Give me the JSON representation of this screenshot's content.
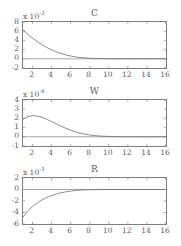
{
  "figure": {
    "background": "#ffffff",
    "line_color": "#6e6e6e",
    "axis_color": "#7d7d7d",
    "text_color": "#5a5a5a"
  },
  "panels": [
    {
      "title": "C",
      "exponent_prefix": "x 10",
      "exponent_value": "-3",
      "y_ticks": [
        "8",
        "6",
        "4",
        "2",
        "0",
        "-2"
      ],
      "x_ticks": [
        "2",
        "4",
        "6",
        "8",
        "10",
        "12",
        "14",
        "16"
      ]
    },
    {
      "title": "W",
      "exponent_prefix": "x 10",
      "exponent_value": "-4",
      "y_ticks": [
        "4",
        "3",
        "2",
        "1",
        "0",
        "-1"
      ],
      "x_ticks": [
        "2",
        "4",
        "6",
        "8",
        "10",
        "12",
        "14",
        "16"
      ]
    },
    {
      "title": "R",
      "exponent_prefix": "x 10",
      "exponent_value": "-3",
      "y_ticks": [
        "2",
        "0",
        "-2",
        "-4",
        "-6"
      ],
      "x_ticks": [
        "2",
        "4",
        "6",
        "8",
        "10",
        "12",
        "14",
        "16"
      ]
    }
  ],
  "chart_data": [
    {
      "type": "line",
      "title": "C",
      "xlabel": "",
      "ylabel": "",
      "y_scale": "1e-3",
      "xlim": [
        1,
        16
      ],
      "ylim": [
        -2,
        8
      ],
      "grid": false,
      "legend": "none",
      "x": [
        1,
        1.5,
        2,
        2.5,
        3,
        3.5,
        4,
        4.5,
        5,
        5.5,
        6,
        6.5,
        7,
        8,
        9,
        10,
        11,
        12,
        13,
        14,
        15,
        16
      ],
      "y": [
        6.3,
        5.35,
        4.5,
        3.75,
        3.05,
        2.45,
        1.95,
        1.5,
        1.15,
        0.85,
        0.6,
        0.42,
        0.28,
        0.12,
        0.05,
        0.02,
        0.01,
        0.0,
        0.0,
        0.0,
        0.0,
        0.0
      ]
    },
    {
      "type": "line",
      "title": "W",
      "xlabel": "",
      "ylabel": "",
      "y_scale": "1e-4",
      "xlim": [
        1,
        16
      ],
      "ylim": [
        -1,
        4
      ],
      "grid": false,
      "legend": "none",
      "x": [
        1,
        1.5,
        2,
        2.5,
        3,
        3.5,
        4,
        4.5,
        5,
        5.5,
        6,
        6.5,
        7,
        7.5,
        8,
        8.5,
        9,
        9.5,
        10,
        11,
        12,
        13,
        14,
        15,
        16
      ],
      "y": [
        1.9,
        2.2,
        2.3,
        2.25,
        2.1,
        1.9,
        1.65,
        1.4,
        1.15,
        0.92,
        0.72,
        0.55,
        0.4,
        0.29,
        0.2,
        0.14,
        0.09,
        0.06,
        0.04,
        0.015,
        0.005,
        0.0,
        0.0,
        0.0,
        0.0
      ]
    },
    {
      "type": "line",
      "title": "R",
      "xlabel": "",
      "ylabel": "",
      "y_scale": "1e-3",
      "xlim": [
        1,
        16
      ],
      "ylim": [
        -6,
        2
      ],
      "grid": false,
      "legend": "none",
      "x": [
        1,
        1.5,
        2,
        2.5,
        3,
        3.5,
        4,
        4.5,
        5,
        5.5,
        6,
        6.5,
        7,
        8,
        9,
        10,
        11,
        12,
        13,
        14,
        15,
        16
      ],
      "y": [
        -4.8,
        -3.75,
        -2.95,
        -2.3,
        -1.8,
        -1.38,
        -1.05,
        -0.78,
        -0.56,
        -0.4,
        -0.28,
        -0.18,
        -0.11,
        -0.04,
        -0.015,
        -0.005,
        0.0,
        0.0,
        0.0,
        0.0,
        0.0,
        0.0
      ]
    }
  ]
}
